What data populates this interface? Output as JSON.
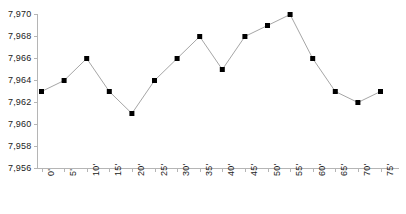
{
  "chart_data": {
    "type": "line",
    "title": "",
    "subtitle": "",
    "xlabel": "",
    "ylabel": "",
    "categories": [
      "0'",
      "5'",
      "10'",
      "15'",
      "20'",
      "25'",
      "30'",
      "35'",
      "40'",
      "45'",
      "50'",
      "55'",
      "60'",
      "65'",
      "70'",
      "75'"
    ],
    "values": [
      7963,
      7964,
      7966,
      7963,
      7961,
      7964,
      7966,
      7968,
      7965,
      7968,
      7969,
      7970,
      7966,
      7963,
      7962,
      7963
    ],
    "series": [
      {
        "name": "",
        "values": [
          7963,
          7964,
          7966,
          7963,
          7961,
          7964,
          7966,
          7968,
          7965,
          7968,
          7969,
          7970,
          7966,
          7963,
          7962,
          7963
        ]
      }
    ],
    "ylim": [
      7956,
      7970
    ],
    "yticks": [
      7956,
      7958,
      7960,
      7962,
      7964,
      7966,
      7968,
      7970
    ],
    "ytick_labels": [
      "7,956",
      "7,958",
      "7,960",
      "7,962",
      "7,964",
      "7,966",
      "7,968",
      "7,970"
    ],
    "xtick_labels": [
      "0'",
      "5'",
      "10'",
      "15'",
      "20'",
      "25'",
      "30'",
      "35'",
      "40'",
      "45'",
      "50'",
      "55'",
      "60'",
      "65'",
      "70'",
      "75'"
    ],
    "grid": false,
    "legend": null,
    "legend_position": "none",
    "marker": "square",
    "marker_color": "#000000",
    "line_color": "#a6a6a6",
    "axis_color": "#b5b5b5",
    "text_color": "#222222",
    "xlabel_rotation": 90
  },
  "axes": {
    "y_tick_labels": [
      "7,970",
      "7,968",
      "7,966",
      "7,964",
      "7,962",
      "7,960",
      "7,958",
      "7,956"
    ],
    "x_tick_labels": [
      "0'",
      "5'",
      "10'",
      "15'",
      "20'",
      "25'",
      "30'",
      "35'",
      "40'",
      "45'",
      "50'",
      "55'",
      "60'",
      "65'",
      "70'",
      "75'"
    ]
  }
}
